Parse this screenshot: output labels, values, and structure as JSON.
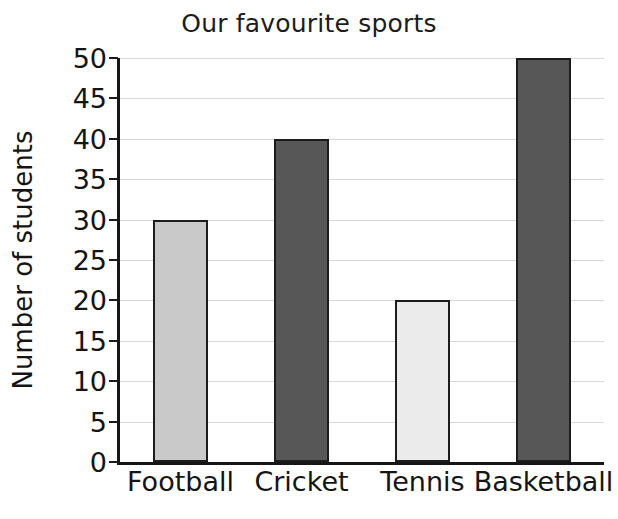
{
  "page": {
    "background_color": "#ffffff",
    "cropped_top_fragments": [
      "g",
      "p"
    ]
  },
  "chart_data": {
    "type": "bar",
    "title": "Our favourite sports",
    "xlabel": "",
    "ylabel": "Number of students",
    "categories": [
      "Football",
      "Cricket",
      "Tennis",
      "Basketball"
    ],
    "values": [
      30,
      40,
      20,
      50
    ],
    "bar_colors": [
      "#c9c9c9",
      "#575757",
      "#ebebeb",
      "#575757"
    ],
    "bar_edge_color": "#1c1c1c",
    "ylim": [
      0,
      50
    ],
    "ytick_labels": [
      "0",
      "5",
      "10",
      "15",
      "20",
      "25",
      "30",
      "35",
      "40",
      "45",
      "50"
    ],
    "ytick_values": [
      0,
      5,
      10,
      15,
      20,
      25,
      30,
      35,
      40,
      45,
      50
    ],
    "grid": true,
    "grid_color": "#d8d8d8",
    "axis_color": "#161616",
    "legend": "none"
  }
}
